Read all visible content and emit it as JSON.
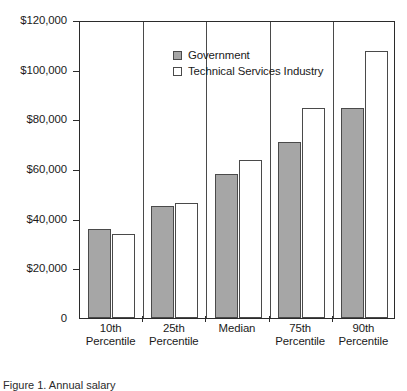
{
  "legend": {
    "position": "top-left-inside",
    "entries": [
      {
        "label": "Government",
        "swatch": "gray-filled-square-icon",
        "color": "#a6a6a6"
      },
      {
        "label": "Technical Services Industry",
        "swatch": "white-outlined-square-icon",
        "color": "#ffffff"
      }
    ]
  },
  "caption": {
    "text": "Figure 1. Annual salary"
  },
  "chart_data": {
    "type": "bar",
    "title": "",
    "subtitle": "",
    "xlabel": "",
    "ylabel": "",
    "ylim": [
      0,
      120000
    ],
    "grid": false,
    "legend_position": "top-left-inside",
    "categories": [
      "10th Percentile",
      "25th Percentile",
      "Median",
      "75th Percentile",
      "90th Percentile"
    ],
    "category_lines": [
      [
        "10th",
        "Percentile"
      ],
      [
        "25th",
        "Percentile"
      ],
      [
        "Median",
        ""
      ],
      [
        "75th",
        "Percentile"
      ],
      [
        "90th",
        "Percentile"
      ]
    ],
    "ytick_labels": [
      "$120,000",
      "$100,000",
      "$80,000",
      "$60,000",
      "$40,000",
      "$20,000",
      "0"
    ],
    "ytick_values": [
      120000,
      100000,
      80000,
      60000,
      40000,
      20000,
      0
    ],
    "series": [
      {
        "name": "Government",
        "color": "#a6a6a6",
        "values": [
          36000,
          45000,
          58000,
          71000,
          84500
        ]
      },
      {
        "name": "Technical Services Industry",
        "color": "#ffffff",
        "values": [
          34000,
          46500,
          63500,
          84500,
          107500
        ]
      }
    ]
  }
}
